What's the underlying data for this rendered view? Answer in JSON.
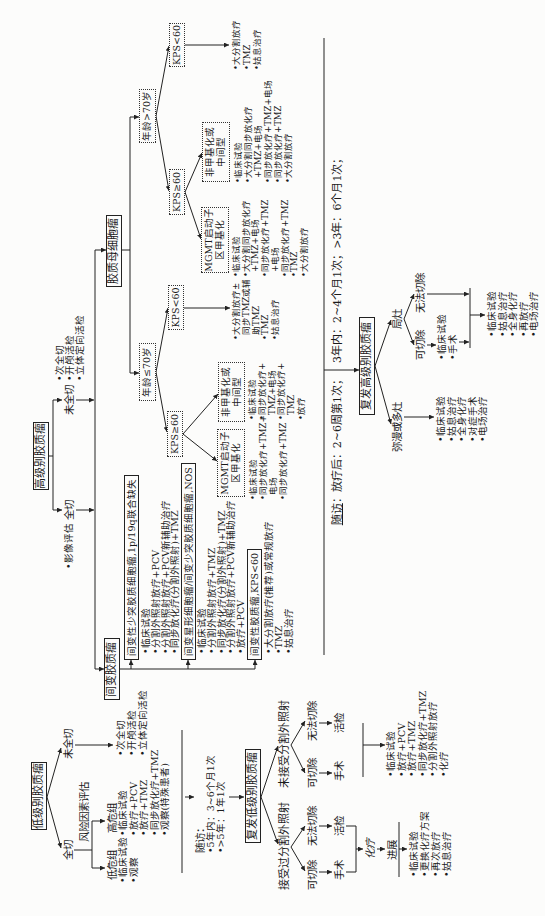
{
  "low_grade": {
    "title": "低级别胶质瘤",
    "gross_total": "全切",
    "non_gross_total": "未全切",
    "risk_assessment": "风险因素评估",
    "low_risk_label": "低危组",
    "low_risk_items": [
      "•临床试验",
      "•观察"
    ],
    "high_risk_label": "高危组",
    "high_risk_items": [
      "•临床试验",
      "•放疗+PCV",
      "•放疗+TMZ",
      "•同步放化疗+TMZ",
      "•观察(特殊患者)"
    ],
    "non_gross_total_items": [
      "•次全切",
      "•开颅活检",
      "•立体定向活检"
    ],
    "follow_up": {
      "label": "随访：",
      "lines": [
        "•5年内：3~6个月1次",
        "•>5年：1年1次"
      ]
    },
    "recurrent": {
      "title": "复发低级别胶质瘤",
      "prior_rt": {
        "label": "接受过分割外照射",
        "resectable": "可切除",
        "unresectable": "无法切除",
        "surgery": "手术",
        "biopsy": "活检",
        "chemo": "化疗",
        "progression": "进展",
        "items": [
          "•临床试验",
          "•更换化疗方案",
          "•再次放疗",
          "•姑息治疗"
        ]
      },
      "no_prior_rt": {
        "label": "未接受分割外照射",
        "resectable": "可切除",
        "unresectable": "无法切除",
        "surgery": "手术",
        "biopsy": "活检",
        "items": [
          "•临床试验",
          "•放疗+PCV",
          "•放疗+TMZ",
          "•同步放化疗+TMZ",
          "•分割外照射放疗",
          "•化疗"
        ]
      }
    }
  },
  "high_grade": {
    "title": "高级别胶质瘤",
    "gross_total": "全切",
    "imaging": "•影像评估",
    "non_gross_total": "未全切",
    "non_gross_total_items": [
      "•次全切",
      "•开颅活检",
      "•立体定向活检"
    ],
    "anaplastic": {
      "title": "间变胶质瘤",
      "groups": [
        {
          "title": "间变性少突胶质细胞瘤,1p/19q联合缺失",
          "items": [
            "•临床试验",
            "•分割外照射放疗+PCV",
            "•分割外照射放疗+PCV新辅助治疗",
            "•同步放化疗(分割外照射)+TMZ"
          ]
        },
        {
          "title": "间变星形细胞瘤/间变少突胶质细胞瘤,NOS",
          "items": [
            "•临床试验",
            "•分割外照射放疗+TMZ",
            "•同步放化疗(分割外照射)+TMZ",
            "•分割外照射放疗+PCV新辅助治疗",
            "•放疗+PCV"
          ]
        },
        {
          "title": "间变性胶质瘤,KPS<60",
          "items": [
            "•大分割放疗(推荐)或常规放疗",
            "•TMZ",
            "•姑息治疗"
          ]
        }
      ]
    },
    "glioblastoma": {
      "title": "胶质母细胞瘤",
      "age_le70": {
        "label": "年龄≤70岁",
        "kps_ge60": {
          "label": "KPS≥60",
          "methylated": {
            "label_lines": [
              "MGMT启动子",
              "区甲基化"
            ],
            "lines": [
              "•临床试验",
              "•同步放化疗+TMZ+",
              "电场",
              "•同步放化疗+TMZ"
            ]
          },
          "unmethylated": {
            "label_lines": [
              "非甲基化或",
              "中间型"
            ],
            "lines": [
              "•临床试验",
              "•同步放化疗+",
              "TMZ+电场",
              "•同步放化疗+",
              "TMZ",
              "•放疗"
            ]
          }
        },
        "kps_lt60": {
          "label": "KPS<60",
          "lines": [
            "•大分割放疗±",
            "同步TMZ或辅",
            "助TMZ",
            "•TMZ",
            "•姑息治疗"
          ]
        }
      },
      "age_gt70": {
        "label": "年龄>70岁",
        "kps_ge60": {
          "label": "KPS≥60",
          "methylated": {
            "label_lines": [
              "MGMT启动子",
              "区甲基化"
            ],
            "lines": [
              "•临床试验",
              "•大分割同步放化疗",
              "+TMZ+电场",
              "•同步放化疗+TMZ",
              "+电场",
              "•同步放化疗+TMZ",
              "•TMZ",
              "•大分割放疗"
            ]
          },
          "unmethylated": {
            "label_lines": [
              "非甲基化或",
              "中间型"
            ],
            "lines": [
              "•临床试验",
              "•大分割同步放化疗",
              "+TMZ+电场",
              "•同步放化疗+TMZ+电场",
              "•同步放化疗+TMZ",
              "•大分割放疗"
            ]
          }
        },
        "kps_lt60": {
          "label": "KPS<60",
          "lines": [
            "•大分割放疗",
            "•TMZ",
            "•姑息治疗"
          ]
        }
      }
    },
    "follow_up": {
      "label": "随访",
      "text_a": "：放疗后：2~6周第1次；",
      "text_b": "3年内：2~4个月1次；>3年：6个月1次；"
    },
    "recurrent": {
      "title": "复发高级别胶质瘤",
      "diffuse": {
        "label": "弥漫或多灶",
        "items": [
          "•临床试验",
          "•姑息治疗",
          "•全身化疗",
          "•对症手术",
          "•电场治疗"
        ]
      },
      "focal": {
        "label": "局灶",
        "resectable": "可切除",
        "resectable_items": [
          "•临床试验",
          "•手术"
        ],
        "unresectable": "无法切除",
        "items": [
          "•临床试验",
          "•姑息治疗",
          "•全身化疗",
          "•再放疗",
          "•电场治疗"
        ]
      }
    }
  }
}
